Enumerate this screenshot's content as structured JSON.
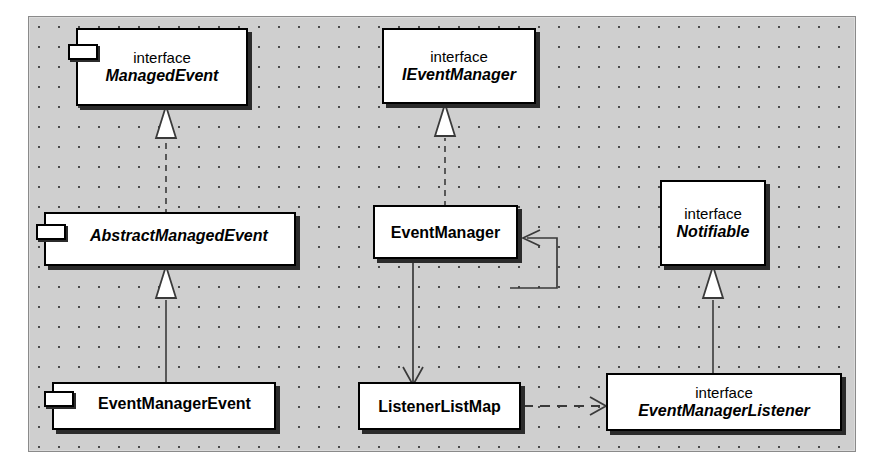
{
  "diagram": {
    "type": "uml-class-diagram",
    "stereotype_label": "interface",
    "canvas": {
      "background_color": "#cfcfcf",
      "grid_dot_color": "#4a4a4a",
      "grid_spacing_px": 20,
      "border_color": "#8a8a8a"
    },
    "node_style": {
      "fill": "#ffffff",
      "stroke": "#000000",
      "shadow": "#2b2b2b"
    },
    "nodes": [
      {
        "id": "managed-event",
        "stereotype": "interface",
        "name": "ManagedEvent",
        "kind": "interface",
        "italic": true,
        "has_tab_icon": true,
        "name_align": "center"
      },
      {
        "id": "ievent-manager",
        "stereotype": "interface",
        "name": "IEventManager",
        "kind": "interface",
        "italic": true,
        "has_tab_icon": false,
        "name_align": "center"
      },
      {
        "id": "notifiable",
        "stereotype": "interface",
        "name": "Notifiable",
        "kind": "interface",
        "italic": true,
        "has_tab_icon": false,
        "name_align": "center"
      },
      {
        "id": "abstract-managed-event",
        "stereotype": "",
        "name": "AbstractManagedEvent",
        "kind": "abstract-class",
        "italic": true,
        "has_tab_icon": true,
        "name_align": "left"
      },
      {
        "id": "event-manager",
        "stereotype": "",
        "name": "EventManager",
        "kind": "class",
        "italic": false,
        "has_tab_icon": false,
        "name_align": "center"
      },
      {
        "id": "event-manager-event",
        "stereotype": "",
        "name": "EventManagerEvent",
        "kind": "class",
        "italic": false,
        "has_tab_icon": true,
        "name_align": "left"
      },
      {
        "id": "listener-list-map",
        "stereotype": "",
        "name": "ListenerListMap",
        "kind": "class",
        "italic": false,
        "has_tab_icon": false,
        "name_align": "center"
      },
      {
        "id": "event-manager-listener",
        "stereotype": "interface",
        "name": "EventManagerListener",
        "kind": "interface",
        "italic": true,
        "has_tab_icon": false,
        "name_align": "center"
      }
    ],
    "edges": [
      {
        "id": "e1",
        "from": "abstract-managed-event",
        "to": "managed-event",
        "relation": "realization",
        "line": "dashed",
        "head": "hollow-triangle"
      },
      {
        "id": "e2",
        "from": "event-manager-event",
        "to": "abstract-managed-event",
        "relation": "generalization",
        "line": "solid",
        "head": "hollow-triangle"
      },
      {
        "id": "e3",
        "from": "event-manager",
        "to": "ievent-manager",
        "relation": "realization",
        "line": "dashed",
        "head": "hollow-triangle"
      },
      {
        "id": "e4",
        "from": "event-manager",
        "to": "listener-list-map",
        "relation": "association",
        "line": "solid",
        "head": "open-arrow"
      },
      {
        "id": "e5",
        "from": "event-manager",
        "to": "event-manager",
        "relation": "self-association",
        "line": "solid",
        "head": "open-arrow"
      },
      {
        "id": "e6",
        "from": "event-manager-listener",
        "to": "notifiable",
        "relation": "generalization",
        "line": "solid",
        "head": "hollow-triangle"
      },
      {
        "id": "e7",
        "from": "listener-list-map",
        "to": "event-manager-listener",
        "relation": "dependency",
        "line": "dashed",
        "head": "open-arrow"
      }
    ]
  }
}
